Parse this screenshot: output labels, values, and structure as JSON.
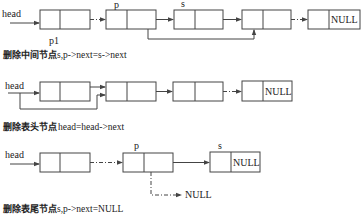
{
  "colors": {
    "line": "#444444",
    "text": "#222222",
    "background": "#ffffff"
  },
  "sections": [
    {
      "id": "delete-middle",
      "head_label": "head",
      "pointer_labels": {
        "p": "p",
        "s": "s",
        "p1": "p1"
      },
      "last_node_text": "NULL",
      "caption_cn": "删除中间节点",
      "caption_code": "s,p->next=s->next"
    },
    {
      "id": "delete-head",
      "head_label": "head",
      "last_node_text": "NULL",
      "caption_cn": "删除表头节点",
      "caption_code": "head=head->next"
    },
    {
      "id": "delete-tail",
      "head_label": "head",
      "pointer_labels": {
        "p": "p",
        "s": "s"
      },
      "last_node_text": "NULL",
      "branch_null_text": "NULL",
      "caption_cn": "删除表尾节点",
      "caption_code": "s,p->next=NULL"
    }
  ]
}
